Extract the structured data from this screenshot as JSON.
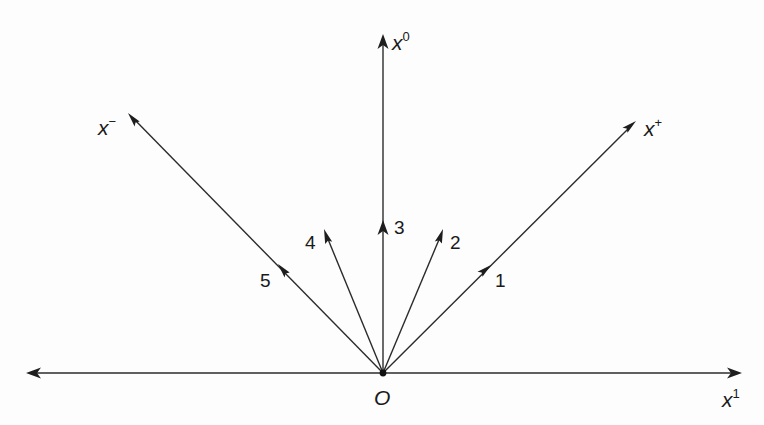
{
  "figure": {
    "colors": {
      "line": "#2b2b2b",
      "text": "#1a1a1a",
      "background": "#fdfdfd"
    },
    "origin": {
      "label": "O",
      "x": 383,
      "y": 373
    },
    "axes": [
      {
        "id": "x0",
        "base": "x",
        "sup": "0",
        "tip": [
          383,
          34
        ],
        "label_pos": [
          392,
          50
        ]
      },
      {
        "id": "x1",
        "base": "x",
        "sup": "1",
        "tip": [
          742,
          373
        ],
        "start": [
          26,
          373
        ],
        "label_pos": [
          722,
          407
        ]
      },
      {
        "id": "xplus",
        "base": "x",
        "sup": "+",
        "tip": [
          636,
          121
        ],
        "label_pos": [
          644,
          136
        ]
      },
      {
        "id": "xminus",
        "base": "x",
        "sup": "−",
        "tip": [
          128,
          113
        ],
        "label_pos": [
          98,
          135
        ]
      }
    ],
    "vectors": [
      {
        "id": "v1",
        "label": "1",
        "tip": [
          491,
          265
        ],
        "label_pos": [
          495,
          287
        ],
        "note": "along x+ direction"
      },
      {
        "id": "v2",
        "label": "2",
        "tip": [
          443,
          229
        ],
        "label_pos": [
          450,
          249
        ]
      },
      {
        "id": "v3",
        "label": "3",
        "tip": [
          383,
          220
        ],
        "label_pos": [
          394,
          234
        ],
        "note": "along x0 direction"
      },
      {
        "id": "v4",
        "label": "4",
        "tip": [
          324,
          229
        ],
        "label_pos": [
          305,
          249
        ]
      },
      {
        "id": "v5",
        "label": "5",
        "tip": [
          278,
          264
        ],
        "label_pos": [
          260,
          287
        ],
        "note": "along x- direction"
      }
    ]
  }
}
